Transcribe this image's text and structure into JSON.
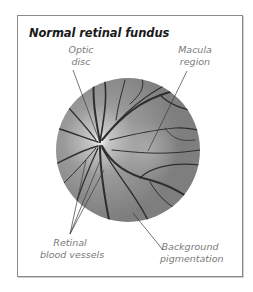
{
  "title": "Normal retinal fundus",
  "labels": {
    "optic_disc": [
      "Optic",
      "disc"
    ],
    "macula": [
      "Macula",
      "region"
    ],
    "vessels": [
      "Retinal",
      "blood vessels"
    ],
    "pigmentation": [
      "Background",
      "pigmentation"
    ]
  },
  "colors": {
    "frame": "#8a8a8a",
    "fundus_base": "#8f8f8f",
    "fundus_light": "#c8c8c8",
    "vessel": "#2e2e2e",
    "label_text": "#7a7a7a",
    "leader_line": "#3a3a3a"
  }
}
